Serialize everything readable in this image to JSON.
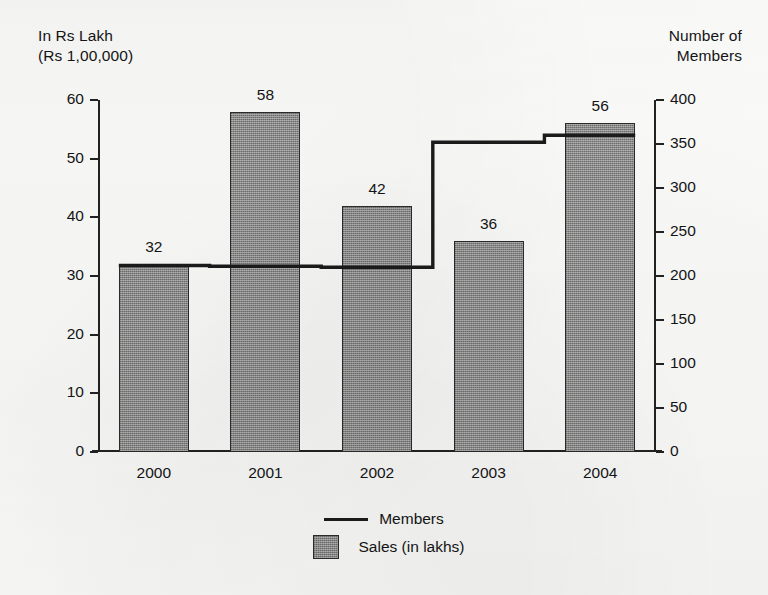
{
  "chart_data": {
    "type": "bar",
    "title": "",
    "categories": [
      "2000",
      "2001",
      "2002",
      "2003",
      "2004"
    ],
    "left_axis": {
      "label": "In Rs Lakh\n(Rs 1,00,000)",
      "ticks": [
        0,
        10,
        20,
        30,
        40,
        50,
        60
      ],
      "ylim": [
        0,
        60
      ]
    },
    "right_axis": {
      "label": "Number of\nMembers",
      "ticks": [
        0,
        50,
        100,
        150,
        200,
        250,
        300,
        350,
        400
      ],
      "ylim": [
        0,
        400
      ]
    },
    "series": [
      {
        "name": "Sales (in lakhs)",
        "type": "bar",
        "axis": "left",
        "values": [
          32,
          58,
          42,
          36,
          56
        ],
        "labels": [
          "32",
          "58",
          "42",
          "36",
          "56"
        ],
        "color": "#8a8a8a"
      },
      {
        "name": "Members",
        "type": "line",
        "axis": "right",
        "values": [
          212,
          211,
          210,
          352,
          360
        ],
        "color": "#1b1b1b"
      }
    ],
    "legend": {
      "position": "bottom",
      "entries": [
        {
          "label": "Members",
          "marker": "line"
        },
        {
          "label": "Sales (in lakhs)",
          "marker": "square"
        }
      ]
    },
    "grid": false,
    "xlabel": "",
    "ylabel": "In Rs Lakh (Rs 1,00,000)"
  },
  "axes": {
    "left_title": "In Rs Lakh\n(Rs 1,00,000)",
    "right_title": "Number of\nMembers",
    "left_ticks": [
      "60",
      "50",
      "40",
      "30",
      "20",
      "10",
      "0"
    ],
    "right_ticks": [
      "400",
      "350",
      "300",
      "250",
      "200",
      "150",
      "100",
      "50",
      "0"
    ],
    "x_ticks": [
      "2000",
      "2001",
      "2002",
      "2003",
      "2004"
    ]
  },
  "bars": {
    "values": [
      "32",
      "58",
      "42",
      "36",
      "56"
    ]
  },
  "legend": {
    "members_label": "Members",
    "sales_label": "Sales (in lakhs)"
  }
}
